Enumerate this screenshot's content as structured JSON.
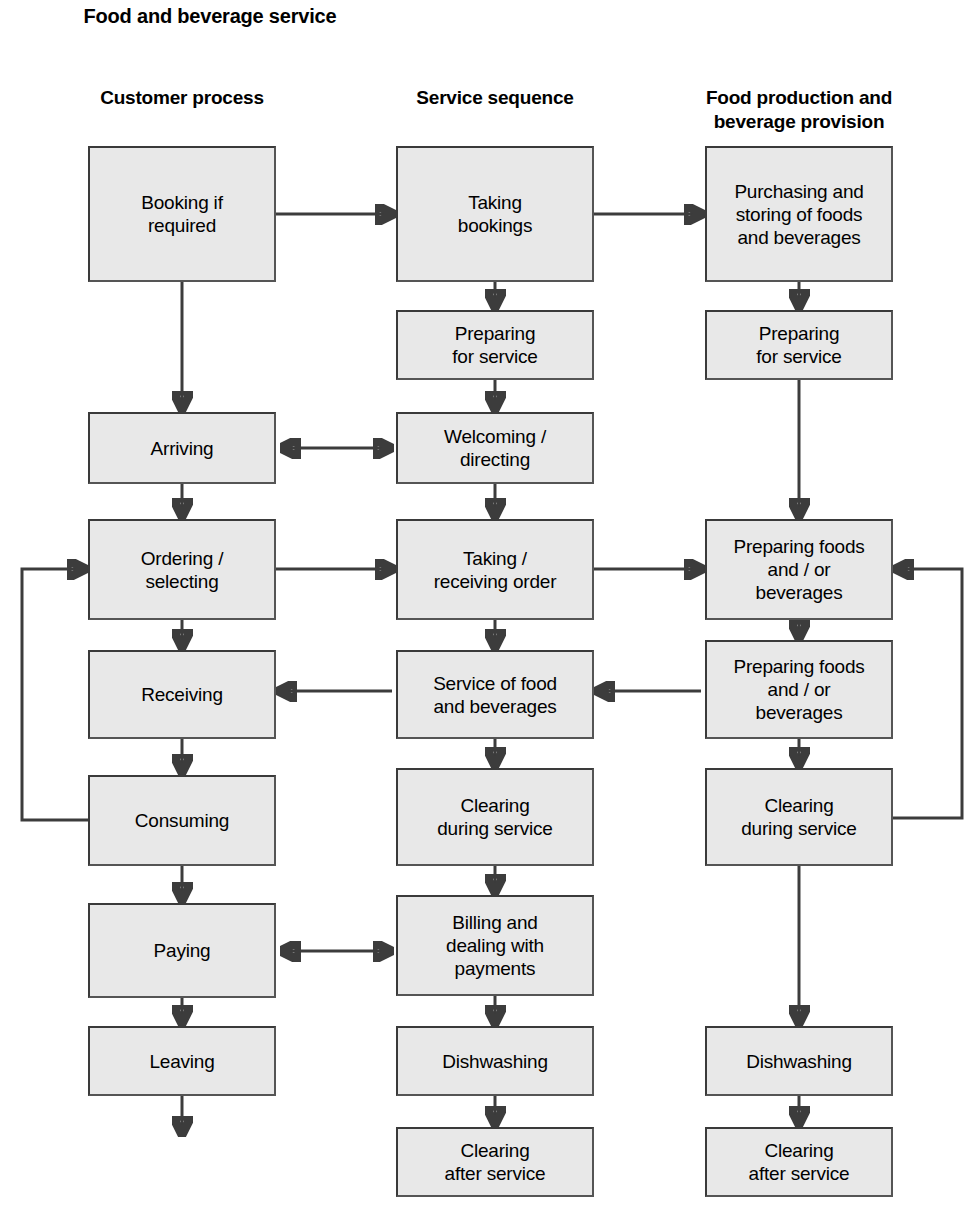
{
  "diagram": {
    "title": "Food and\nbeverage service",
    "columns": [
      {
        "id": "customer-process",
        "header": "Customer\nprocess"
      },
      {
        "id": "service-sequence",
        "header": "Service\nsequence"
      },
      {
        "id": "food-production",
        "header": "Food production and\nbeverage provision"
      }
    ],
    "node_fill": "#e8e8e8",
    "node_border": "#3a3a3a",
    "arrow_color": "#3c3c3c",
    "nodes": [
      {
        "id": "booking-if-required",
        "col": 0,
        "label": "Booking if\nrequired",
        "x": 88,
        "y": 146,
        "w": 188,
        "h": 136
      },
      {
        "id": "arriving",
        "col": 0,
        "label": "Arriving",
        "x": 88,
        "y": 412,
        "h": 72,
        "w": 188
      },
      {
        "id": "ordering-selecting",
        "col": 0,
        "label": "Ordering  /\nselecting",
        "x": 88,
        "y": 519,
        "w": 188,
        "h": 101
      },
      {
        "id": "receiving",
        "col": 0,
        "label": "Receiving",
        "x": 88,
        "y": 650,
        "w": 188,
        "h": 89
      },
      {
        "id": "consuming",
        "col": 0,
        "label": "Consuming",
        "x": 88,
        "y": 775,
        "w": 188,
        "h": 91
      },
      {
        "id": "paying",
        "col": 0,
        "label": "Paying",
        "x": 88,
        "y": 903,
        "w": 188,
        "h": 95
      },
      {
        "id": "leaving",
        "col": 0,
        "label": "Leaving",
        "x": 88,
        "y": 1026,
        "w": 188,
        "h": 70
      },
      {
        "id": "taking-bookings",
        "col": 1,
        "label": "Taking\nbookings",
        "x": 396,
        "y": 146,
        "w": 198,
        "h": 136
      },
      {
        "id": "preparing-for-service-m",
        "col": 1,
        "label": "Preparing\nfor service",
        "x": 396,
        "y": 310,
        "w": 198,
        "h": 70
      },
      {
        "id": "welcoming-directing",
        "col": 1,
        "label": "Welcoming /\ndirecting",
        "x": 396,
        "y": 412,
        "w": 198,
        "h": 72
      },
      {
        "id": "taking-receiving-order",
        "col": 1,
        "label": "Taking /\nreceiving order",
        "x": 396,
        "y": 519,
        "w": 198,
        "h": 101
      },
      {
        "id": "service-of-food",
        "col": 1,
        "label": "Service of food\nand beverages",
        "x": 396,
        "y": 650,
        "w": 198,
        "h": 89
      },
      {
        "id": "clearing-during-service-m",
        "col": 1,
        "label": "Clearing\nduring service",
        "x": 396,
        "y": 768,
        "w": 198,
        "h": 98
      },
      {
        "id": "billing-and-payments",
        "col": 1,
        "label": "Billing and\ndealing with\npayments",
        "x": 396,
        "y": 895,
        "w": 198,
        "h": 101
      },
      {
        "id": "dishwashing-m",
        "col": 1,
        "label": "Dishwashing",
        "x": 396,
        "y": 1026,
        "w": 198,
        "h": 70
      },
      {
        "id": "clearing-after-service-m",
        "col": 1,
        "label": "Clearing\nafter service",
        "x": 396,
        "y": 1127,
        "w": 198,
        "h": 70
      },
      {
        "id": "purchasing-storing",
        "col": 2,
        "label": "Purchasing and\nstoring of foods\nand beverages",
        "x": 705,
        "y": 146,
        "w": 188,
        "h": 136
      },
      {
        "id": "preparing-for-service-r",
        "col": 2,
        "label": "Preparing\nfor service",
        "x": 705,
        "y": 310,
        "w": 188,
        "h": 70
      },
      {
        "id": "preparing-foods-1",
        "col": 2,
        "label": "Preparing foods\nand / or\nbeverages",
        "x": 705,
        "y": 519,
        "w": 188,
        "h": 101
      },
      {
        "id": "preparing-foods-2",
        "col": 2,
        "label": "Preparing foods\nand / or\nbeverages",
        "x": 705,
        "y": 640,
        "w": 188,
        "h": 99
      },
      {
        "id": "clearing-during-service-r",
        "col": 2,
        "label": "Clearing\nduring service",
        "x": 705,
        "y": 768,
        "w": 188,
        "h": 98
      },
      {
        "id": "dishwashing-r",
        "col": 2,
        "label": "Dishwashing",
        "x": 705,
        "y": 1026,
        "w": 188,
        "h": 70
      },
      {
        "id": "clearing-after-service-r",
        "col": 2,
        "label": "Clearing\nafter service",
        "x": 705,
        "y": 1127,
        "w": 188,
        "h": 70
      }
    ],
    "connectors": [
      {
        "id": "booking-to-taking-bookings",
        "kind": "arrow-right"
      },
      {
        "id": "taking-bookings-to-purchasing",
        "kind": "arrow-right"
      },
      {
        "id": "booking-to-arriving",
        "kind": "arrow-down"
      },
      {
        "id": "taking-bookings-to-preparing",
        "kind": "arrow-down"
      },
      {
        "id": "purchasing-to-preparing",
        "kind": "arrow-down"
      },
      {
        "id": "preparing-m-to-welcoming",
        "kind": "arrow-down"
      },
      {
        "id": "preparing-r-to-preparing-foods-1",
        "kind": "arrow-down"
      },
      {
        "id": "arriving-welcoming",
        "kind": "arrow-double"
      },
      {
        "id": "arriving-to-ordering",
        "kind": "arrow-down"
      },
      {
        "id": "welcoming-to-taking-order",
        "kind": "arrow-down"
      },
      {
        "id": "ordering-to-taking-order",
        "kind": "arrow-right"
      },
      {
        "id": "taking-order-to-preparing-foods",
        "kind": "arrow-right"
      },
      {
        "id": "ordering-to-receiving",
        "kind": "arrow-down"
      },
      {
        "id": "taking-order-to-service-of-food",
        "kind": "arrow-down"
      },
      {
        "id": "preparing-foods-1-to-2",
        "kind": "arrow-down"
      },
      {
        "id": "preparing-foods-2-to-service",
        "kind": "arrow-left"
      },
      {
        "id": "service-of-food-to-receiving",
        "kind": "arrow-left"
      },
      {
        "id": "receiving-to-consuming",
        "kind": "arrow-down"
      },
      {
        "id": "service-to-clearing-m",
        "kind": "arrow-down"
      },
      {
        "id": "preparing-foods-2-to-clearing-r",
        "kind": "arrow-down"
      },
      {
        "id": "consuming-loop-to-ordering",
        "kind": "loop-left"
      },
      {
        "id": "clearing-r-loop-to-preparing-foods",
        "kind": "loop-right"
      },
      {
        "id": "consuming-to-paying",
        "kind": "arrow-down"
      },
      {
        "id": "clearing-m-to-billing",
        "kind": "arrow-down"
      },
      {
        "id": "paying-billing",
        "kind": "arrow-double"
      },
      {
        "id": "paying-to-leaving",
        "kind": "arrow-down"
      },
      {
        "id": "billing-to-dishwashing-m",
        "kind": "arrow-down"
      },
      {
        "id": "clearing-r-to-dishwashing-r",
        "kind": "arrow-down"
      },
      {
        "id": "leaving-exit",
        "kind": "arrow-down"
      },
      {
        "id": "dishwashing-m-to-clearing-after-m",
        "kind": "arrow-down"
      },
      {
        "id": "dishwashing-r-to-clearing-after-r",
        "kind": "arrow-down"
      }
    ]
  }
}
